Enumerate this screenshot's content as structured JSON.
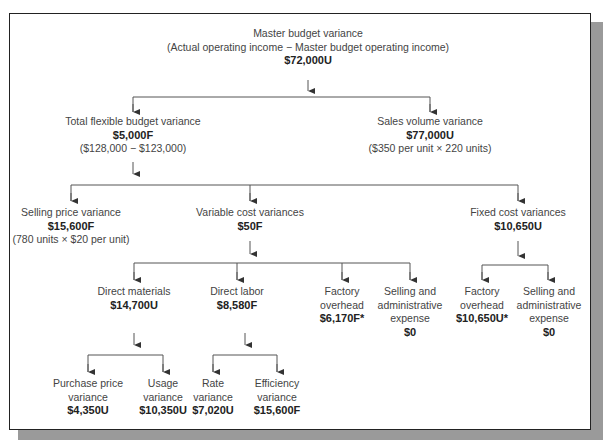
{
  "diagram": {
    "type": "tree",
    "root": {
      "title": "Master budget variance",
      "formula": "(Actual operating income − Master budget operating income)",
      "amount": "$72,000U"
    },
    "level1": {
      "flexible": {
        "title": "Total flexible budget variance",
        "amount": "$5,000F",
        "formula": "($128,000 − $123,000)"
      },
      "sales_volume": {
        "title": "Sales volume variance",
        "amount": "$77,000U",
        "formula": "($350 per unit × 220 units)"
      }
    },
    "level2": {
      "selling_price": {
        "title": "Selling price variance",
        "amount": "$15,600F",
        "formula": "(780 units × $20 per unit)"
      },
      "variable_cost": {
        "title": "Variable cost variances",
        "amount": "$50F"
      },
      "fixed_cost": {
        "title": "Fixed cost variances",
        "amount": "$10,650U"
      }
    },
    "level3": {
      "direct_materials": {
        "title": "Direct materials",
        "amount": "$14,700U"
      },
      "direct_labor": {
        "title": "Direct labor",
        "amount": "$8,580F"
      },
      "var_overhead": {
        "line1": "Factory",
        "line2": "overhead",
        "amount": "$6,170F*"
      },
      "var_sga": {
        "line1": "Selling and",
        "line2": "administrative",
        "line3": "expense",
        "amount": "$0"
      },
      "fixed_overhead": {
        "line1": "Factory",
        "line2": "overhead",
        "amount": "$10,650U*"
      },
      "fixed_sga": {
        "line1": "Selling and",
        "line2": "administrative",
        "line3": "expense",
        "amount": "$0"
      }
    },
    "level4": {
      "purchase_price": {
        "line1": "Purchase price",
        "line2": "variance",
        "amount": "$4,350U"
      },
      "usage": {
        "line1": "Usage",
        "line2": "variance",
        "amount": "$10,350U"
      },
      "rate": {
        "line1": "Rate",
        "line2": "variance",
        "amount": "$7,020U"
      },
      "efficiency": {
        "line1": "Efficiency",
        "line2": "variance",
        "amount": "$15,600F"
      }
    },
    "colors": {
      "line": "#555555",
      "text": "#444444",
      "border": "#222222",
      "shadow": "#9a9a9a"
    }
  }
}
